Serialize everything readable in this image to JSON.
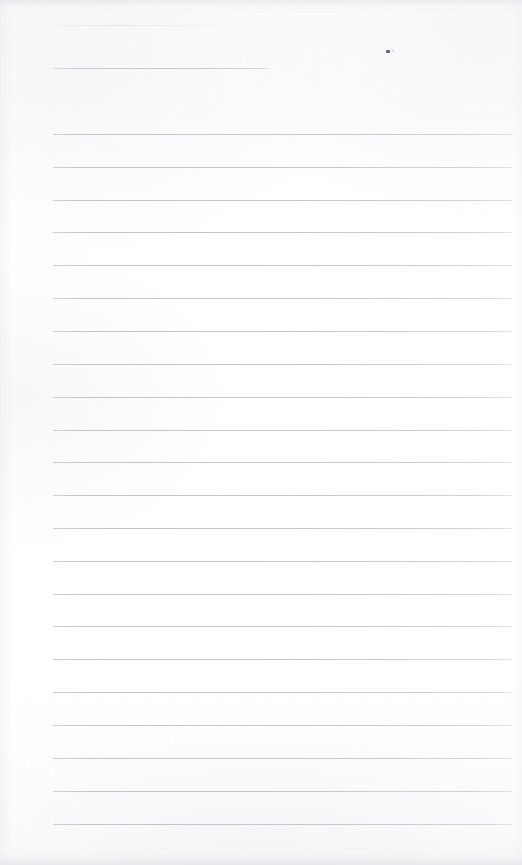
{
  "document": {
    "kind": "scanned-lined-notebook-page",
    "title_text": "",
    "body_text": "",
    "page_width": 522,
    "page_height": 865,
    "paper_color": "#fdfdfe",
    "rule_color": "#c7c7cd",
    "ink_mark_color": "#4c4c54"
  },
  "header": {
    "faint_line": {
      "x": 55,
      "y": 25,
      "width": 160
    },
    "underline": {
      "x": 53,
      "y": 68,
      "width": 217
    }
  },
  "marks": [
    {
      "name": "ink-speck",
      "x": 386,
      "y": 50,
      "width": 4,
      "height": 3
    }
  ],
  "ruling": {
    "left": 53,
    "right": 512,
    "width": 459,
    "first_line_y": 134,
    "spacing": 32.85,
    "line_count": 22,
    "lines_y": [
      134,
      167,
      200,
      232,
      265,
      298,
      331,
      364,
      397,
      430,
      462,
      495,
      528,
      561,
      594,
      626,
      659,
      692,
      725,
      758,
      791,
      824
    ]
  }
}
